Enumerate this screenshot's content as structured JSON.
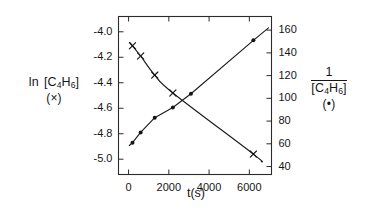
{
  "figure": {
    "background_color": "#ffffff",
    "ink_color": "#1a1a1a"
  },
  "labels": {
    "left_axis_main": "ln",
    "left_axis_species_open": "[C",
    "left_axis_sub1": "4",
    "left_axis_H": "H",
    "left_axis_sub2": "6",
    "left_axis_close": "]",
    "left_axis_marker": "(×)",
    "right_axis_numerator": "1",
    "right_axis_species_open": "[C",
    "right_axis_sub1": "4",
    "right_axis_H": "H",
    "right_axis_sub2": "6",
    "right_axis_close": "]",
    "right_axis_marker": "(•)",
    "x_axis_title": "t(s)"
  },
  "chart_data": {
    "type": "line",
    "title": "",
    "subtitle": "",
    "xlabel": "t(s)",
    "ylabel": "ln [C4H6]",
    "y2label": "1/[C4H6]",
    "grid": false,
    "legend": "none",
    "xlim": [
      -500,
      7100
    ],
    "xticks": [
      0,
      2000,
      4000,
      6000
    ],
    "xticklabels": [
      "0",
      "2000",
      "4000",
      "6000"
    ],
    "ylim": [
      -5.12,
      -3.88
    ],
    "yticks": [
      -4.0,
      -4.2,
      -4.4,
      -4.6,
      -4.8,
      -5.0
    ],
    "yticklabels": [
      "-4.0",
      "-4.2",
      "-4.4",
      "-4.6",
      "-4.8",
      "-5.0"
    ],
    "y2lim": [
      33,
      172
    ],
    "y2ticks": [
      40,
      60,
      80,
      100,
      120,
      140,
      160
    ],
    "y2ticklabels": [
      "40",
      "60",
      "80",
      "100",
      "120",
      "140",
      "160"
    ],
    "series": [
      {
        "name": "ln [C4H6]",
        "marker": "x",
        "axis": "left",
        "shape": "curved",
        "x": [
          195,
          600,
          1300,
          2200,
          6200
        ],
        "y": [
          -4.11,
          -4.19,
          -4.34,
          -4.48,
          -4.96
        ]
      },
      {
        "name": "1/[C4H6]",
        "marker": "dot",
        "axis": "right",
        "shape": "straight",
        "x": [
          195,
          600,
          1300,
          2200,
          3100,
          6200
        ],
        "y": [
          61,
          70,
          83,
          92,
          104,
          151
        ]
      }
    ],
    "annotations": []
  }
}
